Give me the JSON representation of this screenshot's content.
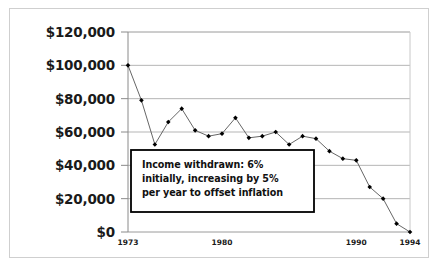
{
  "figure": {
    "background_color": "#ffffff",
    "frame_color": "#cfcfcf"
  },
  "annotation": {
    "line1": "Income withdrawn:  6%",
    "line2": "initially, increasing by 5%",
    "line3": "per year to offset inflation",
    "border_color": "#000000",
    "fill_color": "#ffffff"
  },
  "axis": {
    "y_ticks": [
      "$0",
      "$20,000",
      "$40,000",
      "$60,000",
      "$80,000",
      "$100,000",
      "$120,000"
    ],
    "x_ticks": [
      "1973",
      "1980",
      "1990",
      "1994"
    ]
  },
  "chart_data": {
    "type": "line",
    "title": "",
    "subtitle": "",
    "xlabel": "",
    "ylabel": "",
    "xlim": [
      1973,
      1994
    ],
    "ylim": [
      0,
      120000
    ],
    "grid": true,
    "legend": false,
    "marker": "diamond",
    "line_color": "#555555",
    "marker_color": "#000000",
    "x": [
      1973,
      1974,
      1975,
      1976,
      1977,
      1978,
      1979,
      1980,
      1981,
      1982,
      1983,
      1984,
      1985,
      1986,
      1987,
      1988,
      1989,
      1990,
      1991,
      1992,
      1993,
      1994
    ],
    "values": [
      100000,
      79000,
      52500,
      66000,
      74000,
      61000,
      57500,
      59000,
      68500,
      56500,
      57500,
      60000,
      52500,
      57500,
      56000,
      48500,
      44000,
      43000,
      27000,
      20000,
      5000,
      0
    ],
    "x_tick_values": [
      1973,
      1980,
      1990,
      1994
    ],
    "y_tick_values": [
      0,
      20000,
      40000,
      60000,
      80000,
      100000,
      120000
    ]
  }
}
